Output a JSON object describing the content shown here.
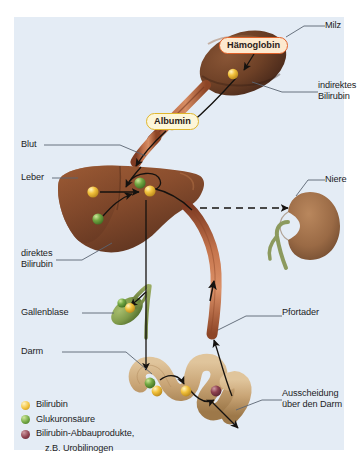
{
  "figure": {
    "background": "#ffffff",
    "panel_color": "#e4ecf5"
  },
  "badges": [
    {
      "name": "haemoglobin",
      "label": "Hämoglobin",
      "border": "#e2622a",
      "fill": "#fde9cf"
    },
    {
      "name": "albumin",
      "label": "Albumin",
      "border": "#e0b62c",
      "fill": "#fdf6d8"
    }
  ],
  "labels": {
    "milz": "Milz",
    "indirektes_bilirubin": "indirektes\nBilirubin",
    "blut": "Blut",
    "leber": "Leber",
    "niere": "Niere",
    "direktes_bilirubin": "direktes\nBilirubin",
    "gallenblase": "Gallenblase",
    "pfortader": "Pfortader",
    "darm": "Darm",
    "ausscheidung": "Ausscheidung\nüber den Darm"
  },
  "legend": [
    {
      "color": "#f2c23c",
      "label": "Bilirubin",
      "label2": ""
    },
    {
      "color": "#72a843",
      "label": "Glukuronsäure",
      "label2": ""
    },
    {
      "color": "#8e4250",
      "label": "Bilirubin-Abbauprodukte,",
      "label2": "z.B. Urobilinogen"
    }
  ],
  "organs": {
    "spleen": {
      "name": "Milz",
      "color": "#6b4028"
    },
    "liver": {
      "name": "Leber",
      "color": "#8a4e2e"
    },
    "kidney": {
      "name": "Niere",
      "color": "#9a6a45"
    },
    "gallbladder": {
      "name": "Gallenblase",
      "color": "#7f9a4a"
    },
    "intestine": {
      "name": "Darm",
      "color": "#c8a477"
    },
    "vessel": {
      "name": "Blutgefäß",
      "color": "#b5603c"
    }
  },
  "molecules": {
    "bilirubin": "#f2c23c",
    "glucuronic_acid": "#72a843",
    "breakdown": "#8e4250"
  }
}
